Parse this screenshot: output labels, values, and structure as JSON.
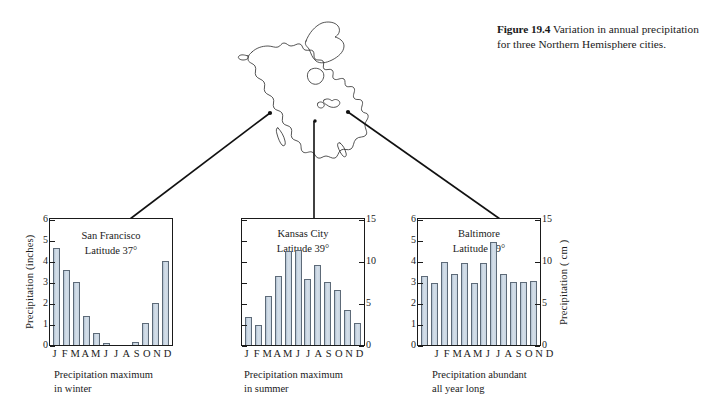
{
  "caption": {
    "label": "Figure 19.4",
    "text": "Variation in annual precipitation for three Northern Hemisphere cities."
  },
  "map": {
    "name": "north-america-outline",
    "cities": [
      "San Francisco",
      "Kansas City",
      "Baltimore"
    ]
  },
  "chart_data": [
    {
      "type": "bar",
      "title": "San Francisco",
      "subtitle_line1": "Latitude 37°",
      "caption_line1": "Precipitation maximum",
      "caption_line2": "in winter",
      "categories": [
        "J",
        "F",
        "M",
        "A",
        "M",
        "J",
        "J",
        "A",
        "S",
        "O",
        "N",
        "D"
      ],
      "values": [
        4.6,
        3.55,
        3.0,
        1.4,
        0.55,
        0.1,
        0.0,
        0.0,
        0.15,
        1.05,
        2.0,
        4.0
      ],
      "xlabel": "",
      "ylabel": "Precipitation (inches)",
      "ylim": [
        0,
        6
      ],
      "yticks": [
        0,
        1,
        2,
        3,
        4,
        5,
        6
      ],
      "ylabel_right": "",
      "ylim_right": null,
      "yticks_right": [],
      "grid": false,
      "legend": false
    },
    {
      "type": "bar",
      "title": "Kansas City",
      "subtitle_line1": "Latitude 39°",
      "caption_line1": "Precipitation maximum",
      "caption_line2": "in summer",
      "categories": [
        "J",
        "F",
        "M",
        "A",
        "M",
        "J",
        "J",
        "A",
        "S",
        "O",
        "N",
        "D"
      ],
      "values": [
        3.3,
        2.4,
        5.8,
        8.2,
        11.2,
        11.3,
        7.9,
        9.5,
        7.5,
        6.5,
        4.2,
        2.6
      ],
      "xlabel": "",
      "ylabel": "",
      "ylim": [
        0,
        15
      ],
      "yticks": [],
      "ylabel_right": "",
      "ylim_right": [
        0,
        15
      ],
      "yticks_right": [
        0,
        5,
        10,
        15
      ],
      "grid": false,
      "legend": false
    },
    {
      "type": "bar",
      "title": "Baltimore",
      "subtitle_line1": "Latitude 39°",
      "caption_line1": "Precipitation abundant",
      "caption_line2": "all year long",
      "categories": [
        "J",
        "F",
        "M",
        "A",
        "M",
        "J",
        "J",
        "A",
        "S",
        "O",
        "N",
        "D"
      ],
      "values": [
        3.3,
        2.95,
        3.95,
        3.4,
        3.9,
        2.95,
        3.9,
        4.9,
        3.4,
        3.0,
        3.0,
        3.05
      ],
      "xlabel": "",
      "ylabel": "",
      "ylim": [
        0,
        6
      ],
      "yticks": [
        0,
        1,
        2,
        3,
        4,
        5,
        6
      ],
      "ylabel_right": "Precipitation ( cm )",
      "ylim_right": [
        0,
        15
      ],
      "yticks_right": [
        0,
        5,
        10,
        15
      ],
      "grid": false,
      "legend": false
    }
  ],
  "colors": {
    "bar_fill": "#c3d0dd",
    "bar_stroke": "#5d6a78",
    "axis": "#1a1a1a",
    "background": "#ffffff"
  }
}
